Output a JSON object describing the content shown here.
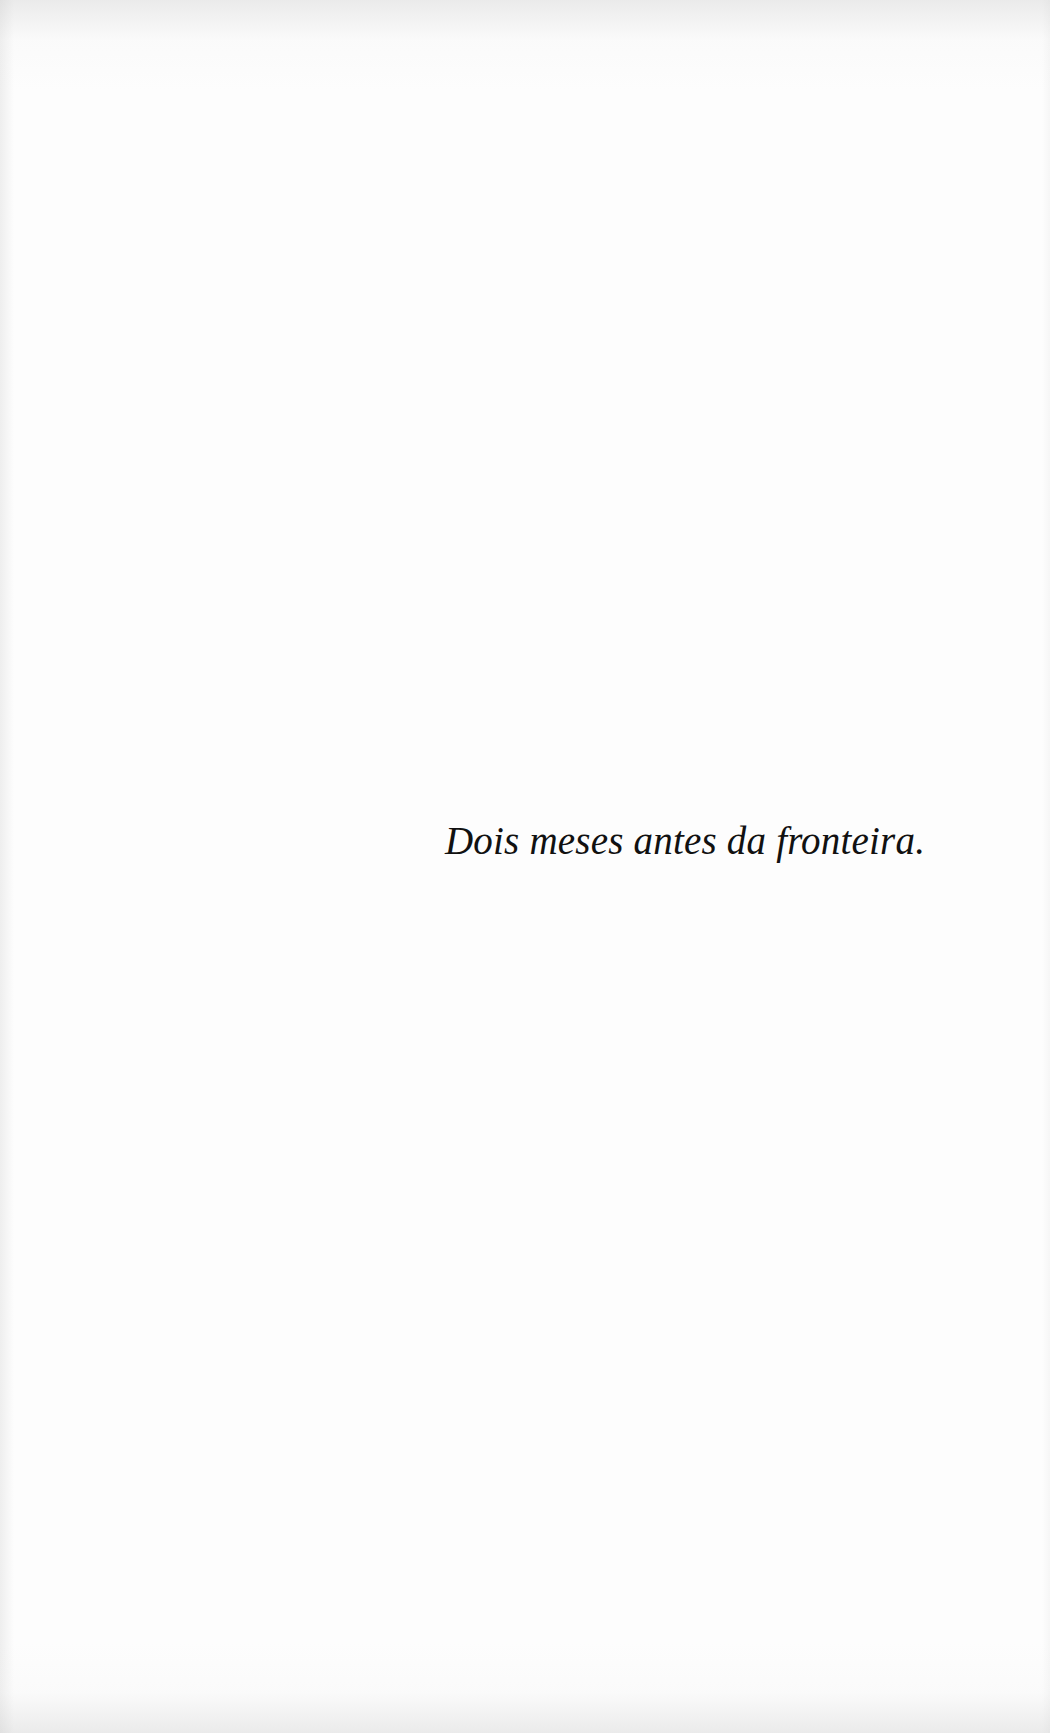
{
  "page": {
    "epigraph": "Dois meses antes da fronteira.",
    "background_color": "#fdfdfd",
    "text_color": "#111111"
  }
}
